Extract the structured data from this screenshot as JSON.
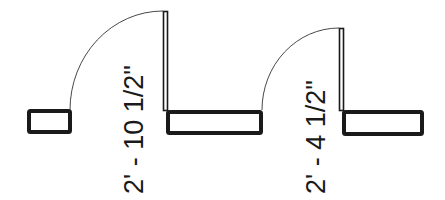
{
  "diagram": {
    "type": "floor-plan-door-openings",
    "colors": {
      "line": "#1a1a1a",
      "background": "#ffffff"
    },
    "doors": [
      {
        "id": "door-1",
        "width_label": "2' - 10 1/2\""
      },
      {
        "id": "door-2",
        "width_label": "2' - 4 1/2\""
      }
    ]
  }
}
